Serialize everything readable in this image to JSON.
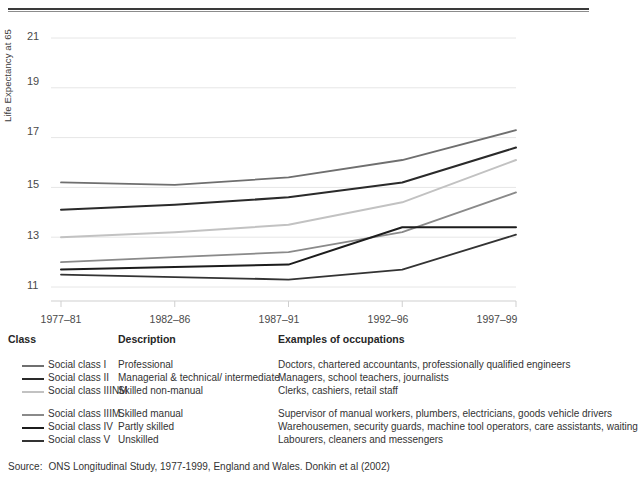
{
  "chart_data": {
    "type": "line",
    "title": "",
    "xlabel": "",
    "ylabel": "Life Expectancy at 65",
    "categories": [
      "1977–81",
      "1982–86",
      "1987–91",
      "1992–96",
      "1997–99"
    ],
    "ylim": [
      11,
      21
    ],
    "yticks": [
      11,
      13,
      15,
      17,
      19,
      21
    ],
    "grid": "horizontal",
    "legend_position": "below-chart-table",
    "series": [
      {
        "name": "Social class I",
        "color": "#6f6f6f",
        "width": 1.8,
        "values": [
          15.2,
          15.1,
          15.4,
          16.1,
          17.3
        ]
      },
      {
        "name": "Social class II",
        "color": "#2a2a2a",
        "width": 2.0,
        "values": [
          14.1,
          14.3,
          14.6,
          15.2,
          16.6
        ]
      },
      {
        "name": "Social class IIINM",
        "color": "#c2c2c2",
        "width": 2.0,
        "values": [
          13.0,
          13.2,
          13.5,
          14.4,
          16.1
        ]
      },
      {
        "name": "Social class IIIM",
        "color": "#8a8a8a",
        "width": 1.8,
        "values": [
          12.0,
          12.2,
          12.4,
          13.2,
          14.8
        ]
      },
      {
        "name": "Social class IV",
        "color": "#1c1c1c",
        "width": 2.0,
        "values": [
          11.7,
          11.8,
          11.9,
          13.4,
          13.4
        ]
      },
      {
        "name": "Social class V",
        "color": "#333333",
        "width": 1.8,
        "values": [
          11.5,
          11.4,
          11.3,
          11.7,
          13.1
        ]
      }
    ]
  },
  "axis": {
    "y_title": "Life Expectancy at 65",
    "y_ticks": [
      "21",
      "19",
      "17",
      "15",
      "13",
      "11"
    ],
    "x_ticks": [
      "1977–81",
      "1982–86",
      "1987–91",
      "1992–96",
      "1997–99"
    ]
  },
  "legend": {
    "headers": {
      "class": "Class",
      "description": "Description",
      "occupations": "Examples of occupations"
    },
    "groups": [
      {
        "rows": [
          {
            "class": "Social class I",
            "description": "Professional",
            "occupations": "Doctors, chartered accountants, professionally qualified engineers",
            "color": "#6f6f6f",
            "thickness": "2px"
          },
          {
            "class": "Social class II",
            "description": "Managerial & technical/ intermediate",
            "occupations": "Managers, school teachers, journalists",
            "color": "#2a2a2a",
            "thickness": "2.4px"
          },
          {
            "class": "Social class IIINM",
            "description": "Skilled non-manual",
            "occupations": "Clerks, cashiers, retail staff",
            "color": "#c2c2c2",
            "thickness": "2.2px"
          }
        ]
      },
      {
        "rows": [
          {
            "class": "Social class IIIM",
            "description": "Skilled manual",
            "occupations": "Supervisor of manual workers, plumbers, electricians, goods vehicle drivers",
            "color": "#8a8a8a",
            "thickness": "2px"
          },
          {
            "class": "Social class IV",
            "description": "Partly skilled",
            "occupations": "Warehousemen, security guards, machine tool operators, care assistants, waiting",
            "color": "#1c1c1c",
            "thickness": "2.6px"
          },
          {
            "class": "Social class V",
            "description": "Unskilled",
            "occupations": "Labourers, cleaners and messengers",
            "color": "#333333",
            "thickness": "2.2px"
          }
        ]
      }
    ]
  },
  "source": {
    "label": "Source:",
    "text": "ONS Longitudinal Study, 1977-1999, England and Wales.  Donkin et al (2002)"
  }
}
